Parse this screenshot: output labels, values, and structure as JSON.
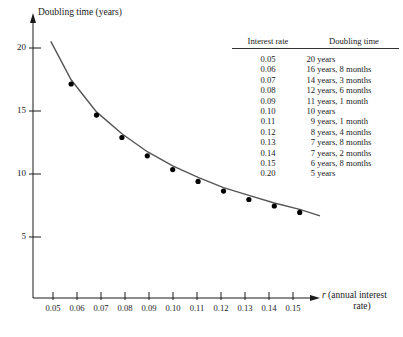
{
  "figure": {
    "background": "#ffffff",
    "ink": "#1a1a1a",
    "curve_color": "#555555",
    "marker_color": "#000000"
  },
  "axes": {
    "y_title": "Doubling time (years)",
    "x_title_line1": "(annual interest",
    "x_title_var": "r",
    "x_title_line2": "rate)",
    "y_ticks": [
      "20",
      "15",
      "10",
      "5"
    ],
    "x_ticks": [
      "0.05",
      "0.06",
      "0.07",
      "0.08",
      "0.09",
      "0.10",
      "0.11",
      "0.12",
      "0.13",
      "0.14",
      "0.15"
    ]
  },
  "table": {
    "header": {
      "rate": "Interest rate",
      "time": "Doubling time"
    },
    "rows": [
      {
        "rate": "0.05",
        "years": "20",
        "time": "years"
      },
      {
        "rate": "0.06",
        "years": "16",
        "time": "years, 8 months"
      },
      {
        "rate": "0.07",
        "years": "14",
        "time": "years, 3 months"
      },
      {
        "rate": "0.08",
        "years": "12",
        "time": "years, 6 months"
      },
      {
        "rate": "0.09",
        "years": "11",
        "time": "years, 1 month"
      },
      {
        "rate": "0.10",
        "years": "10",
        "time": "years"
      },
      {
        "rate": "0.11",
        "years": "9",
        "time": "years, 1 month"
      },
      {
        "rate": "0.12",
        "years": "8",
        "time": "years, 4 months"
      },
      {
        "rate": "0.13",
        "years": "7",
        "time": "years, 8 months"
      },
      {
        "rate": "0.14",
        "years": "7",
        "time": "years, 2 months"
      },
      {
        "rate": "0.15",
        "years": "6",
        "time": "years, 8 months"
      },
      {
        "rate": "0.20",
        "years": "5",
        "time": "years"
      }
    ]
  },
  "chart_data": {
    "type": "line",
    "title": "",
    "xlabel": "r (annual interest rate)",
    "ylabel": "Doubling time (years)",
    "xlim": [
      0.045,
      0.158
    ],
    "ylim": [
      0,
      21.5
    ],
    "grid": false,
    "legend": "none",
    "series": [
      {
        "name": "Doubling time curve",
        "kind": "curve",
        "x": [
          0.052,
          0.06,
          0.07,
          0.08,
          0.09,
          0.1,
          0.11,
          0.12,
          0.13,
          0.14,
          0.15,
          0.158
        ],
        "y": [
          20.0,
          17.0,
          14.5,
          12.8,
          11.4,
          10.3,
          9.4,
          8.6,
          8.0,
          7.4,
          6.9,
          6.4
        ]
      },
      {
        "name": "Computed doubling times",
        "kind": "markers",
        "x": [
          0.06,
          0.07,
          0.08,
          0.09,
          0.1,
          0.11,
          0.12,
          0.13,
          0.14,
          0.15
        ],
        "y": [
          16.67,
          14.25,
          12.5,
          11.08,
          10.0,
          9.08,
          8.33,
          7.67,
          7.17,
          6.67
        ]
      }
    ]
  }
}
